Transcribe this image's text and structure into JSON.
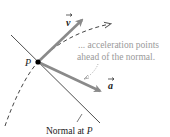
{
  "diagram": {
    "point_label": "P",
    "velocity_label": "v",
    "acceleration_label": "a",
    "annotation_line1": "... acceleration points",
    "annotation_line2": "ahead of the normal.",
    "normal_label_prefix": "Normal at ",
    "normal_label_point": "P"
  },
  "colors": {
    "vector": "#8a8a8a",
    "annotation": "#9a9a9a",
    "line": "#222222",
    "point": "#000000",
    "background": "#ffffff"
  }
}
